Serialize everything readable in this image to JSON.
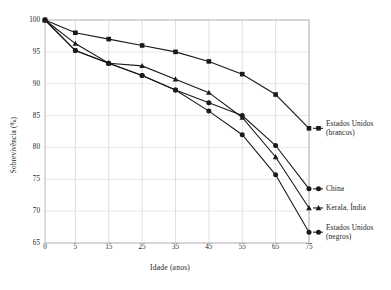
{
  "chart_data": {
    "type": "line",
    "title": "",
    "xlabel": "Idade (anos)",
    "ylabel": "Sobrevivência (%)",
    "x": [
      0,
      5,
      15,
      25,
      35,
      45,
      55,
      65,
      75
    ],
    "xticklabels": [
      "0",
      "5",
      "15",
      "25",
      "35",
      "45",
      "55",
      "65",
      "75"
    ],
    "yticklabels": [
      "65",
      "70",
      "75",
      "80",
      "85",
      "90",
      "95",
      "100"
    ],
    "xlim": [
      0,
      75
    ],
    "ylim": [
      65,
      100
    ],
    "grid": "vertical-and-horizontal",
    "legend_position": "right-of-plot-at-line-ends",
    "series": [
      {
        "name": "Estados Unidos (brancos)",
        "label_line1": "Estados Unidos",
        "label_line2": "(brancos)",
        "marker": "square",
        "color": "#1a1a1a",
        "values": [
          100,
          98,
          97,
          96,
          95,
          93.5,
          91.5,
          88.3,
          83
        ]
      },
      {
        "name": "China",
        "label_line1": "China",
        "label_line2": "",
        "marker": "circle",
        "color": "#1a1a1a",
        "values": [
          100,
          95.2,
          93.2,
          91.3,
          89,
          87,
          85,
          80.3,
          73.5
        ]
      },
      {
        "name": "Kerala, Índia",
        "label_line1": "Kerala, Índia",
        "label_line2": "",
        "marker": "triangle",
        "color": "#1a1a1a",
        "values": [
          100,
          96.3,
          93.2,
          92.8,
          90.7,
          88.6,
          84.7,
          78.5,
          70.5
        ]
      },
      {
        "name": "Estados Unidos (negros)",
        "label_line1": "Estados Unidos",
        "label_line2": "(negros)",
        "marker": "circle",
        "color": "#1a1a1a",
        "values": [
          100,
          95.2,
          93.2,
          91.3,
          89,
          85.7,
          82,
          75.7,
          66.7
        ]
      }
    ],
    "colors": {
      "line": "#1a1a1a",
      "frame": "#b9b9bd",
      "grid": "#d8d8dc",
      "background": "#ffffff",
      "text": "#1c1c1c"
    }
  }
}
